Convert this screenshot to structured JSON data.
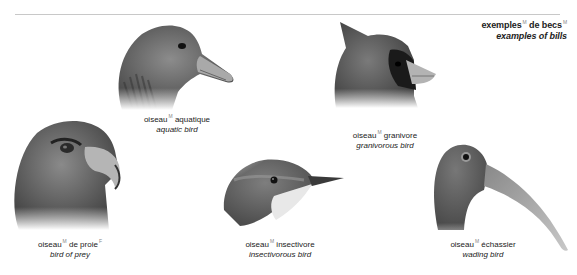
{
  "header": {
    "title_fr": "exemples",
    "title_fr_gender": "M",
    "title_fr_2": "de becs",
    "title_fr_2_gender": "M",
    "title_en": "examples of bills"
  },
  "birds": [
    {
      "id": "aquatic",
      "fr": "oiseau",
      "fr_gender": "M",
      "fr_2": "aquatique",
      "en": "aquatic bird"
    },
    {
      "id": "granivorous",
      "fr": "oiseau",
      "fr_gender": "M",
      "fr_2": "granivore",
      "en": "granivorous bird"
    },
    {
      "id": "prey",
      "fr": "oiseau",
      "fr_gender": "M",
      "fr_2": "de proie",
      "fr_2_gender": "F",
      "en": "bird of prey"
    },
    {
      "id": "insectivorous",
      "fr": "oiseau",
      "fr_gender": "M",
      "fr_2": "insectivore",
      "en": "insectivorous bird"
    },
    {
      "id": "wading",
      "fr": "oiseau",
      "fr_gender": "M",
      "fr_2": "échassier",
      "en": "wading bird"
    }
  ],
  "colors": {
    "rule": "#c8c8c8",
    "text": "#222222",
    "gender_mark": "#888888"
  }
}
